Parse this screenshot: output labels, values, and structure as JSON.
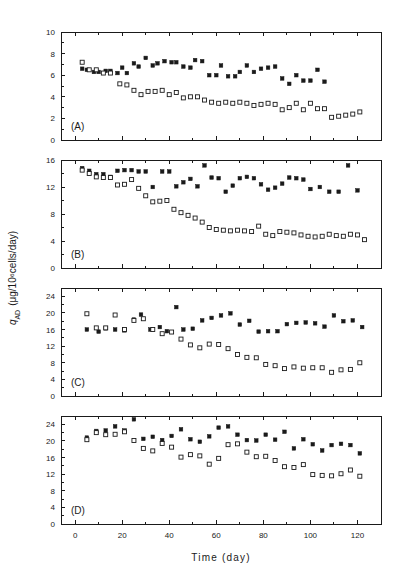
{
  "figure": {
    "xlabel": "Time (day)",
    "ylabel_main": "q",
    "ylabel_sub": "AD",
    "ylabel_units": "(μg/10⁶cells/day)",
    "background_color": "#ffffff",
    "ink_color": "#1a1a1a"
  },
  "chart_data": [
    {
      "type": "scatter",
      "panel": "(A)",
      "title": "",
      "xlabel": "Time (day)",
      "ylabel": "q_AD (μg/10⁶cells/day)",
      "xlim": [
        -6,
        130
      ],
      "ylim": [
        0,
        10
      ],
      "xticks": [
        0,
        20,
        40,
        60,
        80,
        100,
        120
      ],
      "yticks": [
        0,
        2,
        4,
        6,
        8,
        10
      ],
      "yticklabels": [
        "0",
        "2",
        "4",
        "6",
        "8",
        "10"
      ],
      "minor_y_count": 1,
      "grid": false,
      "legend": "none",
      "series": [
        {
          "name": "filled-square",
          "marker": "filled-square",
          "x": [
            3,
            5,
            8,
            10,
            13,
            15,
            18,
            20,
            22,
            25,
            27,
            30,
            33,
            35,
            38,
            41,
            43,
            46,
            49,
            51,
            54,
            57,
            60,
            62,
            65,
            68,
            70,
            73,
            76,
            79,
            82,
            85,
            88,
            91,
            94,
            97,
            100,
            103,
            106
          ],
          "y": [
            6.6,
            6.5,
            6.3,
            6.3,
            6.4,
            6.4,
            6.2,
            6.7,
            6.2,
            7.1,
            6.8,
            7.6,
            6.9,
            7.1,
            7.3,
            7.2,
            7.2,
            6.8,
            6.7,
            7.4,
            7.3,
            6.0,
            6.0,
            6.9,
            5.9,
            5.9,
            6.3,
            6.9,
            6.3,
            6.6,
            6.7,
            6.8,
            5.7,
            5.2,
            6.0,
            5.5,
            5.5,
            6.5,
            5.4
          ]
        },
        {
          "name": "open-square",
          "marker": "open-square",
          "x": [
            3,
            6,
            9,
            12,
            15,
            19,
            22,
            25,
            28,
            31,
            34,
            37,
            40,
            43,
            46,
            49,
            52,
            55,
            58,
            61,
            64,
            67,
            70,
            73,
            76,
            79,
            82,
            85,
            88,
            91,
            94,
            97,
            100,
            103,
            106,
            109,
            112,
            115,
            118,
            121
          ],
          "y": [
            7.2,
            6.5,
            6.5,
            6.2,
            6.2,
            5.2,
            5.1,
            4.6,
            4.2,
            4.5,
            4.5,
            4.6,
            4.2,
            4.4,
            3.9,
            4.0,
            4.0,
            3.7,
            3.5,
            3.4,
            3.5,
            3.4,
            3.5,
            3.4,
            3.2,
            3.3,
            3.4,
            3.3,
            2.8,
            3.0,
            3.4,
            2.8,
            3.4,
            2.9,
            2.9,
            2.1,
            2.2,
            2.3,
            2.4,
            2.6
          ]
        }
      ]
    },
    {
      "type": "scatter",
      "panel": "(B)",
      "title": "",
      "xlabel": "Time (day)",
      "ylabel": "q_AD (μg/10⁶cells/day)",
      "xlim": [
        -6,
        130
      ],
      "ylim": [
        0,
        16
      ],
      "xticks": [
        0,
        20,
        40,
        60,
        80,
        100,
        120
      ],
      "yticks": [
        0,
        4,
        8,
        12,
        16
      ],
      "yticklabels": [
        "0",
        "4",
        "8",
        "12",
        "16"
      ],
      "minor_y_count": 1,
      "grid": false,
      "legend": "none",
      "series": [
        {
          "name": "filled-square",
          "marker": "filled-square",
          "x": [
            3,
            6,
            9,
            12,
            15,
            18,
            21,
            24,
            27,
            30,
            33,
            37,
            40,
            43,
            46,
            49,
            52,
            55,
            58,
            61,
            64,
            67,
            70,
            73,
            76,
            79,
            82,
            85,
            88,
            91,
            94,
            97,
            100,
            104,
            108,
            112,
            116,
            120
          ],
          "y": [
            14.8,
            14.4,
            13.9,
            13.9,
            13.5,
            14.4,
            14.5,
            14.5,
            14.3,
            14.3,
            12.0,
            14.3,
            14.3,
            12.1,
            12.7,
            13.2,
            12.1,
            15.2,
            13.4,
            13.3,
            11.3,
            12.2,
            13.3,
            13.5,
            13.3,
            12.4,
            11.6,
            11.9,
            12.5,
            13.4,
            13.3,
            13.1,
            11.7,
            12.0,
            11.3,
            11.3,
            15.2,
            11.5
          ]
        },
        {
          "name": "open-square",
          "marker": "open-square",
          "x": [
            3,
            6,
            9,
            12,
            15,
            18,
            21,
            24,
            27,
            30,
            33,
            36,
            39,
            42,
            45,
            48,
            51,
            54,
            57,
            60,
            63,
            66,
            69,
            72,
            75,
            78,
            81,
            84,
            87,
            90,
            93,
            96,
            99,
            102,
            105,
            108,
            111,
            114,
            117,
            120,
            123
          ],
          "y": [
            14.5,
            14.0,
            13.5,
            13.4,
            13.4,
            12.3,
            12.4,
            13.1,
            11.8,
            10.7,
            9.8,
            9.9,
            10.0,
            8.7,
            8.2,
            7.8,
            7.4,
            6.8,
            6.0,
            5.7,
            5.6,
            5.5,
            5.6,
            5.5,
            5.4,
            6.2,
            5.0,
            4.8,
            5.4,
            5.3,
            5.2,
            4.9,
            4.7,
            4.6,
            4.7,
            5.0,
            4.8,
            4.7,
            5.0,
            4.9,
            4.2
          ]
        }
      ]
    },
    {
      "type": "scatter",
      "panel": "(C)",
      "title": "",
      "xlabel": "Time (day)",
      "ylabel": "q_AD (μg/10⁶cells/day)",
      "xlim": [
        -6,
        130
      ],
      "ylim": [
        0,
        26
      ],
      "xticks": [
        0,
        20,
        40,
        60,
        80,
        100,
        120
      ],
      "yticks": [
        0,
        4,
        8,
        12,
        16,
        20,
        24
      ],
      "yticklabels": [
        "0",
        "4",
        "8",
        "12",
        "16",
        "20",
        "24"
      ],
      "minor_y_count": 1,
      "grid": false,
      "legend": "none",
      "series": [
        {
          "name": "filled-square",
          "marker": "filled-square",
          "x": [
            5,
            10,
            13,
            17,
            21,
            25,
            28,
            32,
            36,
            39,
            43,
            46,
            50,
            54,
            58,
            62,
            66,
            70,
            74,
            78,
            82,
            86,
            90,
            94,
            98,
            102,
            106,
            110,
            114,
            118,
            122
          ],
          "y": [
            16.0,
            15.5,
            16.3,
            16.0,
            15.8,
            18.4,
            19.6,
            16.0,
            16.6,
            15.6,
            21.4,
            16.0,
            16.2,
            18.2,
            18.8,
            19.4,
            19.9,
            17.2,
            18.1,
            15.5,
            15.6,
            15.6,
            17.3,
            17.6,
            17.7,
            17.5,
            16.7,
            19.4,
            18.0,
            18.2,
            16.6
          ]
        },
        {
          "name": "open-square",
          "marker": "open-square",
          "x": [
            5,
            9,
            13,
            17,
            21,
            25,
            29,
            33,
            37,
            41,
            45,
            49,
            53,
            57,
            61,
            65,
            69,
            73,
            77,
            81,
            85,
            89,
            93,
            97,
            101,
            105,
            109,
            113,
            117,
            121
          ],
          "y": [
            19.8,
            16.4,
            16.4,
            19.5,
            16.0,
            18.2,
            18.6,
            16.0,
            15.0,
            15.4,
            13.7,
            12.3,
            11.6,
            12.5,
            12.4,
            11.4,
            10.0,
            9.3,
            9.2,
            7.6,
            7.3,
            6.6,
            7.0,
            6.7,
            6.8,
            6.8,
            5.7,
            6.3,
            6.4,
            8.0
          ]
        }
      ]
    },
    {
      "type": "scatter",
      "panel": "(D)",
      "title": "",
      "xlabel": "Time (day)",
      "ylabel": "q_AD (μg/10⁶cells/day)",
      "xlim": [
        -6,
        130
      ],
      "ylim": [
        0,
        26
      ],
      "xticks": [
        0,
        20,
        40,
        60,
        80,
        100,
        120
      ],
      "yticks": [
        0,
        4,
        8,
        12,
        16,
        20,
        24
      ],
      "yticklabels": [
        "0",
        "4",
        "8",
        "12",
        "16",
        "20",
        "24"
      ],
      "minor_y_count": 1,
      "grid": false,
      "legend": "none",
      "series": [
        {
          "name": "filled-square",
          "marker": "filled-square",
          "x": [
            5,
            9,
            13,
            17,
            21,
            25,
            29,
            33,
            37,
            41,
            45,
            49,
            53,
            57,
            61,
            65,
            69,
            73,
            77,
            81,
            85,
            89,
            93,
            97,
            101,
            105,
            109,
            113,
            117,
            121
          ],
          "y": [
            20.8,
            22.4,
            22.5,
            23.5,
            22.5,
            25.2,
            20.5,
            21.0,
            20.2,
            21.2,
            22.8,
            20.4,
            19.8,
            21.1,
            23.2,
            23.5,
            21.5,
            20.2,
            20.1,
            21.5,
            20.3,
            22.2,
            18.2,
            20.4,
            19.2,
            17.7,
            19.0,
            19.3,
            19.0,
            17.0
          ]
        },
        {
          "name": "open-square",
          "marker": "open-square",
          "x": [
            5,
            9,
            13,
            17,
            21,
            25,
            29,
            33,
            37,
            41,
            45,
            49,
            53,
            57,
            61,
            65,
            69,
            73,
            77,
            81,
            85,
            89,
            93,
            97,
            101,
            105,
            109,
            113,
            117,
            121
          ],
          "y": [
            20.3,
            22.0,
            21.5,
            21.6,
            22.2,
            20.1,
            18.2,
            17.6,
            19.4,
            18.5,
            16.1,
            16.7,
            16.4,
            14.4,
            15.8,
            19.1,
            19.3,
            17.3,
            16.2,
            16.3,
            15.3,
            13.8,
            13.6,
            14.3,
            11.9,
            11.7,
            11.6,
            12.1,
            13.0,
            11.5
          ]
        }
      ]
    }
  ]
}
